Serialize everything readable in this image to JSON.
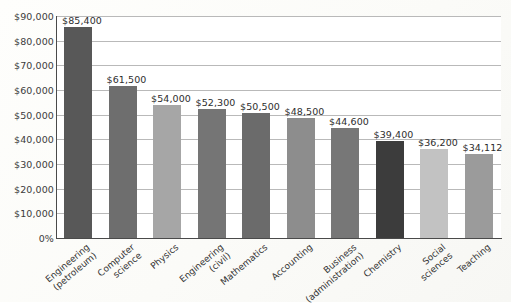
{
  "chart_data": {
    "type": "bar",
    "title": "",
    "subtitle": "",
    "xlabel": "",
    "ylabel": "",
    "categories": [
      "Engineering (petroleum)",
      "Computer science",
      "Physics",
      "Engineering (civil)",
      "Mathematics",
      "Accounting",
      "Business (administration)",
      "Chemistry",
      "Social sciences",
      "Teaching"
    ],
    "category_lines": [
      [
        "Engineering",
        "(petroleum)"
      ],
      [
        "Computer",
        "science"
      ],
      [
        "Physics"
      ],
      [
        "Engineering",
        "(civil)"
      ],
      [
        "Mathematics"
      ],
      [
        "Accounting"
      ],
      [
        "Business",
        "(administration)"
      ],
      [
        "Chemistry"
      ],
      [
        "Social",
        "sciences"
      ],
      [
        "Teaching"
      ]
    ],
    "values": [
      85400,
      61500,
      54000,
      52300,
      50500,
      48500,
      44600,
      39400,
      36200,
      34112
    ],
    "value_labels": [
      "$85,400",
      "$61,500",
      "$54,000",
      "$52,300",
      "$50,500",
      "$48,500",
      "$44,600",
      "$39,400",
      "$36,200",
      "$34,112"
    ],
    "bar_colors": [
      "#585858",
      "#6e6e6e",
      "#a6a6a6",
      "#757575",
      "#6b6b6b",
      "#8d8d8d",
      "#777777",
      "#3c3c3c",
      "#c2c2c2",
      "#9b9b9b"
    ],
    "ylim": [
      0,
      90000
    ],
    "ytick_values": [
      0,
      10000,
      20000,
      30000,
      40000,
      50000,
      60000,
      70000,
      80000,
      90000
    ],
    "ytick_labels": [
      "0%",
      "$10,000",
      "$20,000",
      "$30,000",
      "$40,000",
      "$50,000",
      "$60,000",
      "$70,000",
      "$80,000",
      "$90,000"
    ],
    "grid": true,
    "legend": false,
    "legend_position": "none",
    "axis_color": "#4a4a4a",
    "gridline_color": "#b9b9b9",
    "plot_background": "#ffffff"
  }
}
